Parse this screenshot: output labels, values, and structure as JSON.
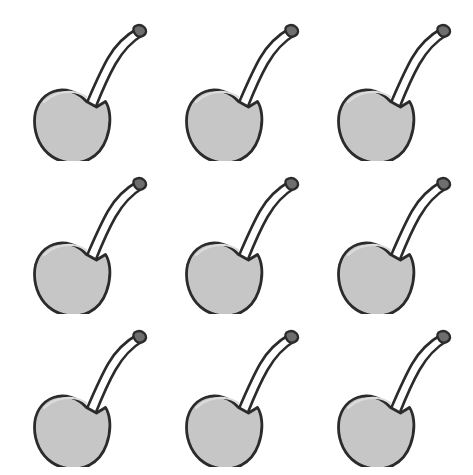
{
  "image": {
    "title": "Cherry illustration grid",
    "description": "A three by three grid of nine identical grayscale cherry line drawings on a white background",
    "background_color": "#ffffff",
    "width": 473,
    "height": 475
  },
  "grid": {
    "rows": 3,
    "columns": 3,
    "total_items": 9,
    "column_pitch": 152,
    "row_pitch": 153
  },
  "style": {
    "body_fill": "#c6c6c6",
    "body_highlight": "#dcdcdc",
    "outline_color": "#2b2b2b",
    "stem_fill": "#ffffff",
    "stem_outline": "#2b2b2b",
    "outline_width": 2.6
  },
  "items": [
    {
      "id": "cherry-1",
      "label": "Cherry 1",
      "row": 1,
      "column": 1
    },
    {
      "id": "cherry-2",
      "label": "Cherry 2",
      "row": 1,
      "column": 2
    },
    {
      "id": "cherry-3",
      "label": "Cherry 3",
      "row": 1,
      "column": 3
    },
    {
      "id": "cherry-4",
      "label": "Cherry 4",
      "row": 2,
      "column": 1
    },
    {
      "id": "cherry-5",
      "label": "Cherry 5",
      "row": 2,
      "column": 2
    },
    {
      "id": "cherry-6",
      "label": "Cherry 6",
      "row": 2,
      "column": 3
    },
    {
      "id": "cherry-7",
      "label": "Cherry 7",
      "row": 3,
      "column": 1
    },
    {
      "id": "cherry-8",
      "label": "Cherry 8",
      "row": 3,
      "column": 2
    },
    {
      "id": "cherry-9",
      "label": "Cherry 9",
      "row": 3,
      "column": 3
    }
  ],
  "shape": {
    "body_center_x": 61,
    "body_center_y": 116,
    "body_width": 78,
    "body_height": 78,
    "stem_tip_x": 129,
    "stem_tip_y": 21,
    "notch_x": 72,
    "notch_y": 94
  }
}
